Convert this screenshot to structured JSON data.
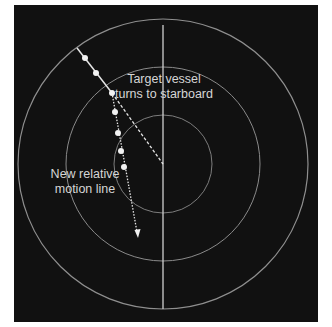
{
  "diagram": {
    "type": "radar-plot",
    "background_color": "#111111",
    "ring_color": "#8a8a8a",
    "line_color": "#e0e0e0",
    "center": {
      "x": 163,
      "y": 164
    },
    "rings": [
      49,
      97,
      145
    ],
    "heading_line": {
      "x1": 163,
      "y1": 25,
      "x2": 163,
      "y2": 309
    },
    "original_track": {
      "start": {
        "x": 77,
        "y": 48
      },
      "end": {
        "x": 163,
        "y": 164
      }
    },
    "plots_before_turn": [
      {
        "x": 85,
        "y": 58
      },
      {
        "x": 96,
        "y": 73
      },
      {
        "x": 112,
        "y": 93
      }
    ],
    "plots_after_turn": [
      {
        "x": 115,
        "y": 112
      },
      {
        "x": 118,
        "y": 133
      },
      {
        "x": 121,
        "y": 151
      },
      {
        "x": 124,
        "y": 167
      }
    ],
    "new_relative_motion_line": {
      "start": {
        "x": 112,
        "y": 93
      },
      "end": {
        "x": 138,
        "y": 236
      }
    },
    "annotations": {
      "turn": {
        "line1": "Target vessel",
        "line2": "turns to starboard"
      },
      "rml": {
        "line1": "New relative",
        "line2": "motion line"
      }
    }
  }
}
